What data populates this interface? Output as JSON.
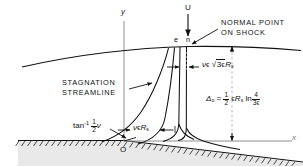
{
  "figure": {
    "type": "flow-field-schematic"
  },
  "axes": {
    "y_label": "y",
    "x_label": "x",
    "origin_label": "O"
  },
  "freestream": {
    "velocity_label": "U"
  },
  "shock_points": {
    "e_label": "e",
    "n_label": "n"
  },
  "annotations": {
    "normal_point_line1": "NORMAL POINT",
    "normal_point_line2": "ON SHOCK",
    "stagnation_line1": "STAGNATION",
    "stagnation_line2": "STREAMLINE"
  },
  "dimensions": {
    "upper_offset": {
      "nu": "ν",
      "epsilon": "ϵ",
      "radical_inner_coeff": "3",
      "radical_inner_eps": "ϵ",
      "radius_symbol": "R",
      "radius_sub": "s",
      "full_text": "νϵ √(3ϵ) R_s"
    },
    "lower_offset": {
      "nu": "ν",
      "epsilon": "ϵ",
      "radius_symbol": "R",
      "radius_sub": "s",
      "full_text": "νϵ R_s"
    },
    "standoff": {
      "symbol": "Δ",
      "symbol_sub": "o",
      "equals": "=",
      "frac_num": "1",
      "frac_den": "2",
      "epsilon": "ϵ",
      "radius_symbol": "R",
      "radius_sub": "s",
      "log": "ln",
      "log_num": "4",
      "log_den_coeff": "3",
      "log_den_eps": "ϵ",
      "full_text": "Δ₀ = ½ ϵR_s ln(4/3ϵ)"
    },
    "angle": {
      "tan": "tan",
      "exponent": "-1",
      "frac_num": "1",
      "frac_den": "2",
      "nu": "ν",
      "full_text": "tan⁻¹ ½ν"
    }
  },
  "colors": {
    "ink": "#111111",
    "dashed_guide": "#9a9a9a",
    "body_fill": "#e6e6e6",
    "background": "#ffffff"
  }
}
